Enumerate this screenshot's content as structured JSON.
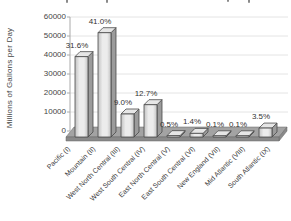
{
  "chart_data": {
    "type": "bar",
    "style": "3d-column-grayscale",
    "title": "",
    "title_clipped": true,
    "ylabel": "Millions of Gallons per Day",
    "xlabel": "",
    "legend": "none",
    "grid": "horizontal",
    "ylim": [
      0,
      60000
    ],
    "y_ticks": [
      0,
      10000,
      20000,
      30000,
      40000,
      50000,
      60000
    ],
    "categories": [
      "Pacific (I)",
      "Mountain (II)",
      "West North Central (III)",
      "West South Central (IV)",
      "East North Central (V)",
      "East South Central (VI)",
      "New England (VII)",
      "Mid Atlantic (VIII)",
      "South Atlantic (IX)"
    ],
    "values": [
      42300,
      54900,
      12100,
      17000,
      700,
      1900,
      150,
      150,
      4700
    ],
    "data_labels": [
      "31.6%",
      "41.0%",
      "9.0%",
      "12.7%",
      "0.5%",
      "1.4%",
      "0.1%",
      "0.1%",
      "3.5%"
    ],
    "colors": {
      "bar_front_light": "#ececec",
      "bar_front_dark": "#c2c2c2",
      "bar_side": "#9b9b9b",
      "bar_top": "#e6e6e6",
      "bar_outline": "#4a4a4a",
      "floor_top": "#a3a3a3",
      "floor_front": "#8a8a8a",
      "floor_outline": "#666666",
      "gridline": "#e4e4e4",
      "axis": "#aaaaaa",
      "text": "#3a3a3a"
    }
  }
}
